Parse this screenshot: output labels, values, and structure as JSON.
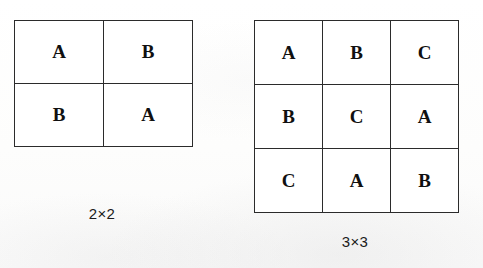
{
  "figure": {
    "background_color": "#fdfdfd",
    "line_color": "#2b2b2b",
    "text_color": "#101010",
    "squares": [
      {
        "name": "2x2",
        "caption": "2×2",
        "symbols": [
          "A",
          "B"
        ],
        "rows": [
          [
            "A",
            "B"
          ],
          [
            "B",
            "A"
          ]
        ]
      },
      {
        "name": "3x3",
        "caption": "3×3",
        "symbols": [
          "A",
          "B",
          "C"
        ],
        "rows": [
          [
            "A",
            "B",
            "C"
          ],
          [
            "B",
            "C",
            "A"
          ],
          [
            "C",
            "A",
            "B"
          ]
        ]
      }
    ]
  }
}
